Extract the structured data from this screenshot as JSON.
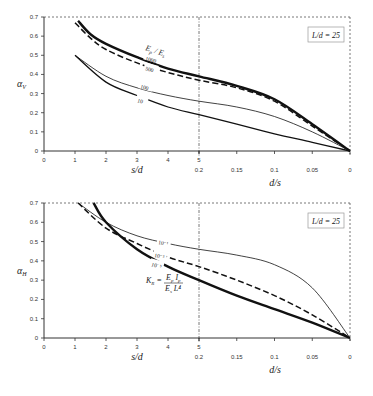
{
  "chart_data": [
    {
      "type": "line",
      "panel": "top",
      "ylabel": "α_v",
      "xlabel_left": "s/d",
      "xlabel_right": "d/s",
      "ylim": [
        0,
        0.7
      ],
      "yticks": [
        "0",
        "0.1",
        "0.2",
        "0.3",
        "0.4",
        "0.5",
        "0.6",
        "0.7"
      ],
      "xticks_left": [
        "0",
        "1",
        "2",
        "3",
        "4",
        "5"
      ],
      "xticks_right": [
        "0.2",
        "0.15",
        "0.1",
        "0.05",
        "0"
      ],
      "legend_box": "L/d = 25",
      "family_label": "E_p / E_s",
      "series": [
        {
          "name": "1000",
          "style": "thick-solid",
          "s_over_d": [
            1.1,
            1.5,
            2,
            3,
            4,
            5
          ],
          "values": [
            0.68,
            0.61,
            0.56,
            0.49,
            0.43,
            0.39
          ],
          "d_over_s": [
            0.2,
            0.15,
            0.1,
            0.05,
            0
          ],
          "values_right": [
            0.39,
            0.34,
            0.27,
            0.14,
            0.0
          ]
        },
        {
          "name": "500",
          "style": "dashed",
          "s_over_d": [
            1.0,
            1.5,
            2,
            3,
            4,
            5
          ],
          "values": [
            0.67,
            0.59,
            0.53,
            0.46,
            0.41,
            0.37
          ],
          "d_over_s": [
            0.2,
            0.15,
            0.1,
            0.05,
            0
          ],
          "values_right": [
            0.37,
            0.33,
            0.26,
            0.13,
            0.0
          ]
        },
        {
          "name": "100",
          "style": "thin-solid",
          "s_over_d": [
            1.0,
            2,
            3,
            4,
            5
          ],
          "values": [
            0.5,
            0.39,
            0.33,
            0.29,
            0.26
          ],
          "d_over_s": [
            0.2,
            0.15,
            0.1,
            0.05,
            0
          ],
          "values_right": [
            0.26,
            0.23,
            0.18,
            0.1,
            0.0
          ]
        },
        {
          "name": "10",
          "style": "medium-solid",
          "s_over_d": [
            1.0,
            2,
            3,
            4,
            5
          ],
          "values": [
            0.5,
            0.36,
            0.29,
            0.23,
            0.19
          ],
          "d_over_s": [
            0.2,
            0.15,
            0.1,
            0.05,
            0
          ],
          "values_right": [
            0.19,
            0.14,
            0.09,
            0.045,
            0.0
          ]
        }
      ]
    },
    {
      "type": "line",
      "panel": "bottom",
      "ylabel": "α_H",
      "xlabel_left": "s/d",
      "xlabel_right": "d/s",
      "ylim": [
        0,
        0.7
      ],
      "yticks": [
        "0",
        "0.1",
        "0.2",
        "0.3",
        "0.4",
        "0.5",
        "0.6",
        "0.7"
      ],
      "xticks_left": [
        "0",
        "1",
        "2",
        "3",
        "4",
        "5"
      ],
      "xticks_right": [
        "0.2",
        "0.15",
        "0.1",
        "0.05",
        "0"
      ],
      "legend_box": "L/d = 25",
      "family_label": "K_R = E_p I_p / (E_s L^4)",
      "series": [
        {
          "name": "10⁻¹",
          "style": "thin-solid",
          "s_over_d": [
            1.1,
            2,
            3,
            4,
            5
          ],
          "values": [
            0.7,
            0.6,
            0.53,
            0.49,
            0.46
          ],
          "d_over_s": [
            0.2,
            0.15,
            0.1,
            0.05,
            0
          ],
          "values_right": [
            0.46,
            0.43,
            0.38,
            0.26,
            0.0
          ]
        },
        {
          "name": "10⁻³",
          "style": "dashed",
          "s_over_d": [
            1.1,
            2,
            3,
            4,
            5
          ],
          "values": [
            0.7,
            0.57,
            0.49,
            0.42,
            0.37
          ],
          "d_over_s": [
            0.2,
            0.15,
            0.1,
            0.05,
            0
          ],
          "values_right": [
            0.37,
            0.3,
            0.22,
            0.12,
            0.0
          ]
        },
        {
          "name": "10⁻⁵",
          "style": "thick-solid",
          "s_over_d": [
            1.6,
            2,
            3,
            4,
            5
          ],
          "values": [
            0.7,
            0.6,
            0.46,
            0.37,
            0.3
          ],
          "d_over_s": [
            0.2,
            0.15,
            0.1,
            0.05,
            0
          ],
          "values_right": [
            0.3,
            0.22,
            0.15,
            0.08,
            0.0
          ]
        }
      ]
    }
  ],
  "top": {
    "ylabel_main": "α",
    "ylabel_sub": "V",
    "legend": "L/d = 25",
    "family_a": "E",
    "family_a_sub": "p",
    "family_b": "E",
    "family_b_sub": "s",
    "labels": {
      "c1000": "1000",
      "c500": "500",
      "c100": "100",
      "c10": "10"
    }
  },
  "bottom": {
    "ylabel_main": "α",
    "ylabel_sub": "H",
    "legend": "L/d = 25",
    "labels": {
      "c1": "10⁻¹",
      "c3": "10⁻³",
      "c5": "10⁻⁵"
    },
    "kr": "K",
    "kr_sub": "R",
    "kr_eq": "=",
    "num": "E",
    "num_sub": "p",
    "num2": "I",
    "num2_sub": "p",
    "den": "E",
    "den_sub": "s",
    "den2": "L⁴"
  },
  "axes": {
    "yticks": [
      "0",
      "0.1",
      "0.2",
      "0.3",
      "0.4",
      "0.5",
      "0.6",
      "0.7"
    ],
    "xleft": [
      "0",
      "1",
      "2",
      "3",
      "4",
      "5"
    ],
    "xright": [
      "0.2",
      "0.15",
      "0.1",
      "0.05",
      "0"
    ],
    "xlabel_left": "s/d",
    "xlabel_right": "d/s"
  }
}
